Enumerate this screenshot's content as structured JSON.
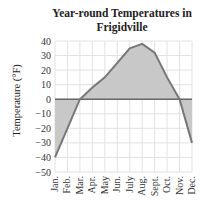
{
  "chart_data": {
    "type": "area",
    "title": "Year-round Temperatures in Frigidville",
    "title_lines": [
      "Year-round Temperatures in",
      "Frigidville"
    ],
    "xlabel": "",
    "ylabel": "Temperature (°F)",
    "categories": [
      "Jan.",
      "Feb.",
      "Mar.",
      "Apr.",
      "May",
      "Jun.",
      "July",
      "Aug.",
      "Sept.",
      "Oct.",
      "Nov.",
      "Dec."
    ],
    "series": [
      {
        "name": "Temperature",
        "values": [
          -40,
          -20,
          0,
          8,
          15,
          25,
          35,
          38,
          32,
          15,
          0,
          -30
        ]
      }
    ],
    "ylim": [
      -50,
      40
    ],
    "yticks": [
      40,
      30,
      20,
      10,
      0,
      -10,
      -20,
      -30,
      -40,
      -50
    ],
    "grid": true,
    "legend": null,
    "colors": {
      "fill": "#c8c8c8",
      "line": "#777777",
      "grid": "#e2e2e2",
      "zero_line": "#666666"
    }
  }
}
